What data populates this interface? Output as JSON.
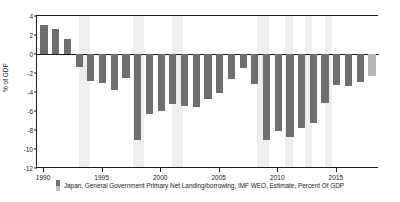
{
  "chart_data": {
    "type": "bar",
    "title": "",
    "xlabel": "",
    "ylabel": "% of GDP",
    "ylim": [
      -12,
      4
    ],
    "xlim": [
      1989.4,
      2018.6
    ],
    "yticks": [
      4,
      2,
      0,
      -2,
      -4,
      -6,
      -8,
      -10,
      -12
    ],
    "ytick_labels": [
      "4",
      "2",
      "0",
      "-2",
      "-4",
      "-6",
      "-8",
      "-10",
      "-12"
    ],
    "xticks": [
      1990,
      1995,
      2000,
      2005,
      2010,
      2015
    ],
    "xtick_labels": [
      "1990",
      "1995",
      "2000",
      "2005",
      "2010",
      "2015"
    ],
    "grid": false,
    "legend_position": "bottom-center",
    "bar_color": "#6e6e6e",
    "estimate_color": "#b8b8b8",
    "shading_color": "#eeeeee",
    "axis_color": "#1a1a1a",
    "categories": [
      1990,
      1991,
      1992,
      1993,
      1994,
      1995,
      1996,
      1997,
      1998,
      1999,
      2000,
      2001,
      2002,
      2003,
      2004,
      2005,
      2006,
      2007,
      2008,
      2009,
      2010,
      2011,
      2012,
      2013,
      2014,
      2015,
      2016,
      2017,
      2018
    ],
    "values": [
      3.1,
      2.65,
      1.6,
      -1.4,
      -2.8,
      -3.1,
      -3.8,
      -2.5,
      -9.1,
      -6.3,
      -6.0,
      -5.3,
      -5.5,
      -5.6,
      -4.7,
      -4.1,
      -2.6,
      -1.5,
      -3.2,
      -9.0,
      -8.1,
      -8.7,
      -7.8,
      -7.3,
      -5.2,
      -3.3,
      -3.4,
      -2.9,
      -2.3
    ],
    "estimate_from": 2018,
    "series": [
      {
        "name": "Japan, General Government Primary Net Landing/borrowing, IMF WEO, Estimate, Percent Of GDP",
        "values": [
          3.1,
          2.65,
          1.6,
          -1.4,
          -2.8,
          -3.1,
          -3.8,
          -2.5,
          -9.1,
          -6.3,
          -6.0,
          -5.3,
          -5.5,
          -5.6,
          -4.7,
          -4.1,
          -2.6,
          -1.5,
          -3.2,
          -9.0,
          -8.1,
          -8.7,
          -7.8,
          -7.3,
          -5.2,
          -3.3,
          -3.4,
          -2.9,
          -2.3
        ]
      }
    ],
    "shaded_bands": [
      [
        1993.0,
        1993.9
      ],
      [
        1997.6,
        1998.5
      ],
      [
        2000.9,
        2001.9
      ],
      [
        2008.2,
        2009.2
      ],
      [
        2010.6,
        2011.3
      ],
      [
        2012.3,
        2012.9
      ],
      [
        2014.0,
        2014.6
      ]
    ]
  },
  "legend": {
    "label": "Japan, General Government Primary Net Landing/borrowing, IMF WEO, Estimate, Percent Of GDP",
    "swatch": "legend-swatch-bar"
  }
}
